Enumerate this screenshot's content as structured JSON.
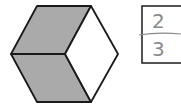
{
  "figure": {
    "shape": "hexagon",
    "parts_total": 3,
    "parts_shaded": 2,
    "colors": {
      "shaded": "#aaaaaa",
      "unshaded": "#ffffff",
      "stroke": "#1a1a1a",
      "answer_ink": "#8a8a8a"
    }
  },
  "answer_box": {
    "numerator": "2",
    "denominator": "3"
  }
}
